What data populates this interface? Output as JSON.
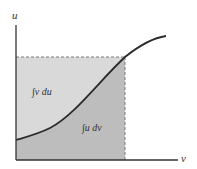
{
  "figure": {
    "axes": {
      "x_label": "v",
      "y_label": "u"
    },
    "regions": [
      {
        "id": "upper",
        "label": "∫v du",
        "color": "#d9d9d9"
      },
      {
        "id": "lower",
        "label": "∫u dv",
        "color": "#bdbdbd"
      }
    ],
    "curve_color": "#2b2b2b",
    "axis_color": "#333333",
    "dash_color": "#7a7a7a"
  }
}
